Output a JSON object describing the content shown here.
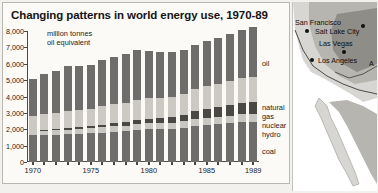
{
  "chart": {
    "title": "Changing patterns in world energy use, 1970-89",
    "subtitle": "million tonnes\noil equivalent",
    "subtitle_line1": "million tonnes",
    "subtitle_line2": "oil equivalent"
  },
  "legend": {
    "oil": "oil",
    "natural_gas_line1": "natural",
    "natural_gas_line2": "gas",
    "nuclear": "nuclear",
    "hydro": "hydro",
    "coal": "coal"
  },
  "map": {
    "cities": [
      {
        "name": "San Francisco",
        "label_x": 2,
        "label_y": 16,
        "dot_x": 12,
        "dot_y": 27
      },
      {
        "name": "Salt Lake City",
        "label_x": 22,
        "label_y": 25,
        "dot_x": 68,
        "dot_y": 22
      },
      {
        "name": "Las Vegas",
        "label_x": 26,
        "label_y": 37,
        "dot_x": 49,
        "dot_y": 48
      },
      {
        "name": "Los Angeles",
        "label_x": 25,
        "label_y": 54,
        "dot_x": 17,
        "dot_y": 56
      },
      {
        "name": "A",
        "label_x": 76,
        "label_y": 57,
        "dot_x": -20,
        "dot_y": -20
      }
    ],
    "colors": {
      "ocean": "#ffffff",
      "land_light": "#d8d6d2",
      "land_mid": "#b3b1ac",
      "land_dark": "#8e8c87",
      "outline": "#3b3b3b"
    }
  },
  "colors": {
    "panel_bg": "#fbfaf7",
    "page_bg": "#f2f1ee",
    "border": "#b9b7b1",
    "axis": "#4a4a4a",
    "coal": "#6f6d6b",
    "hydro": "#c9c7c2",
    "nuclear": "#4a4845",
    "natural_gas": "#ccc9c2",
    "oil": "#6f6d6b",
    "bar_gap": "#fbfaf7"
  },
  "chart_data": {
    "type": "bar",
    "stacked": true,
    "title": "Changing patterns in world energy use, 1970-89",
    "xlabel": "",
    "ylabel": "million tonnes oil equivalent",
    "ylim": [
      0,
      8000
    ],
    "yticks": [
      0,
      1000,
      2000,
      3000,
      4000,
      5000,
      6000,
      7000,
      8000
    ],
    "ytick_labels": [
      "0",
      "1,000",
      "2,000",
      "3,000",
      "4,000",
      "5,000",
      "6,000",
      "7,000",
      "8,000"
    ],
    "grid": false,
    "legend_position": "right",
    "categories": [
      1970,
      1971,
      1972,
      1973,
      1974,
      1975,
      1976,
      1977,
      1978,
      1979,
      1980,
      1981,
      1982,
      1983,
      1984,
      1985,
      1986,
      1987,
      1988,
      1989
    ],
    "xtick_labels": [
      "1970",
      "1975",
      "1980",
      "1985",
      "1989"
    ],
    "xtick_years": [
      1970,
      1975,
      1980,
      1985,
      1989
    ],
    "series": [
      {
        "name": "coal",
        "values": [
          1620,
          1640,
          1650,
          1690,
          1710,
          1750,
          1800,
          1850,
          1880,
          1960,
          2000,
          2000,
          2010,
          2070,
          2180,
          2260,
          2300,
          2370,
          2440,
          2460
        ]
      },
      {
        "name": "hydro",
        "values": [
          260,
          270,
          280,
          285,
          300,
          310,
          315,
          330,
          345,
          355,
          370,
          380,
          390,
          410,
          425,
          440,
          455,
          465,
          480,
          490
        ]
      },
      {
        "name": "nuclear",
        "values": [
          40,
          50,
          65,
          80,
          100,
          130,
          160,
          190,
          220,
          240,
          280,
          330,
          370,
          420,
          500,
          560,
          600,
          630,
          670,
          690
        ]
      },
      {
        "name": "natural gas",
        "values": [
          920,
          960,
          1000,
          1040,
          1060,
          1070,
          1120,
          1150,
          1190,
          1240,
          1230,
          1230,
          1230,
          1250,
          1330,
          1370,
          1400,
          1460,
          1530,
          1580
        ]
      },
      {
        "name": "oil",
        "values": [
          2260,
          2430,
          2580,
          2760,
          2710,
          2670,
          2830,
          2900,
          2980,
          3060,
          2910,
          2780,
          2690,
          2680,
          2730,
          2750,
          2840,
          2890,
          2970,
          3010
        ]
      }
    ],
    "totals": [
      5100,
      5350,
      5575,
      5855,
      5880,
      5930,
      6225,
      6420,
      6615,
      6855,
      6790,
      6720,
      6690,
      6830,
      7165,
      7380,
      7595,
      7815,
      8090,
      8230
    ]
  }
}
